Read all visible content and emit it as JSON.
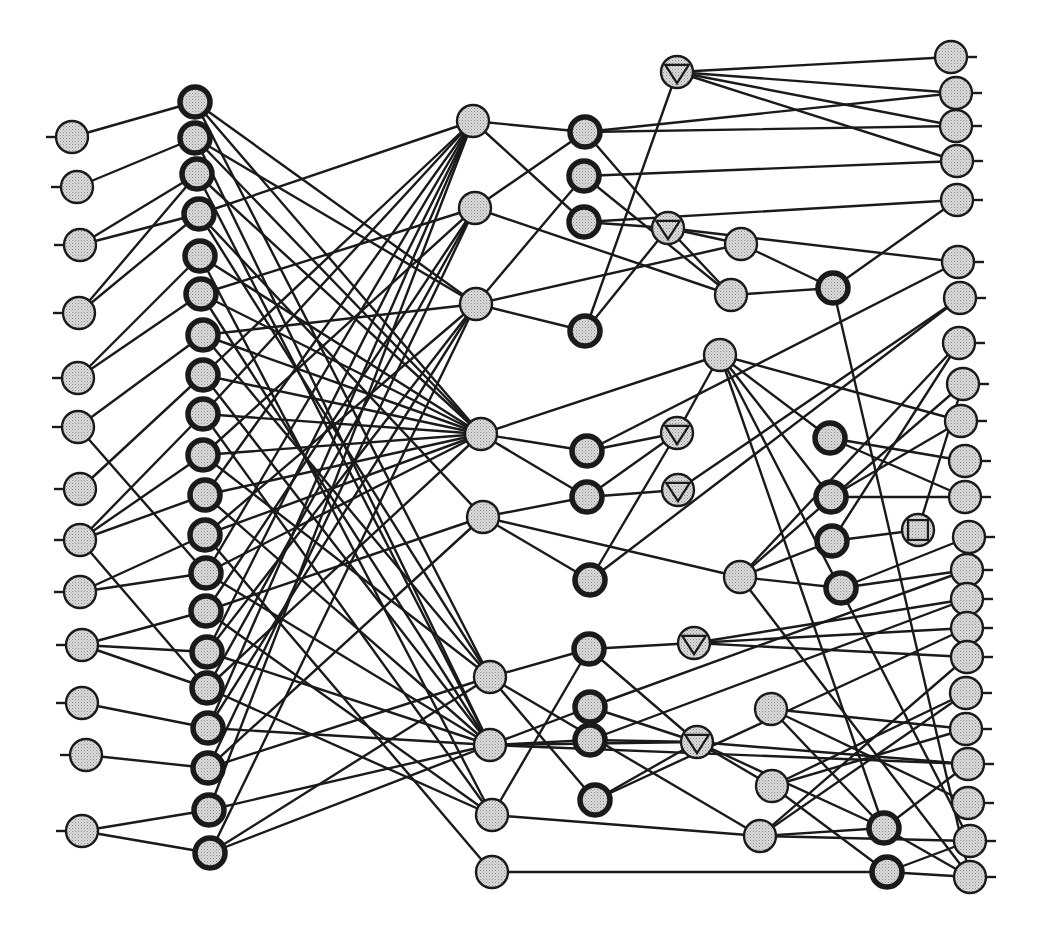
{
  "diagram": {
    "style": {
      "background": "#ffffff",
      "stroke": "#1a1a1a",
      "node_fill": "#d8d8d8",
      "node_dot": "#8a8a8a",
      "node_radius": 16
    },
    "node_types": {
      "input": "plain circle with left stub",
      "hidden_bold": "thick-bordered circle",
      "hidden": "plain circle",
      "triangle": "circle with inscribed down-triangle",
      "square": "circle with inscribed square",
      "output": "plain circle with right stub"
    },
    "nodes": [
      {
        "id": "I1",
        "type": "input",
        "x": 72,
        "y": 137
      },
      {
        "id": "I2",
        "type": "input",
        "x": 77,
        "y": 187
      },
      {
        "id": "I3",
        "type": "input",
        "x": 80,
        "y": 245
      },
      {
        "id": "I4",
        "type": "input",
        "x": 79,
        "y": 313
      },
      {
        "id": "I5",
        "type": "input",
        "x": 78,
        "y": 378
      },
      {
        "id": "I6",
        "type": "input",
        "x": 78,
        "y": 427
      },
      {
        "id": "I7",
        "type": "input",
        "x": 80,
        "y": 489
      },
      {
        "id": "I8",
        "type": "input",
        "x": 80,
        "y": 540
      },
      {
        "id": "I9",
        "type": "input",
        "x": 80,
        "y": 592
      },
      {
        "id": "I10",
        "type": "input",
        "x": 82,
        "y": 645
      },
      {
        "id": "I11",
        "type": "input",
        "x": 82,
        "y": 703
      },
      {
        "id": "I12",
        "type": "input",
        "x": 86,
        "y": 755
      },
      {
        "id": "I13",
        "type": "input",
        "x": 82,
        "y": 831
      },
      {
        "id": "B1",
        "type": "hidden_bold",
        "x": 195,
        "y": 102
      },
      {
        "id": "B2",
        "type": "hidden_bold",
        "x": 195,
        "y": 138
      },
      {
        "id": "B3",
        "type": "hidden_bold",
        "x": 197,
        "y": 174
      },
      {
        "id": "B4",
        "type": "hidden_bold",
        "x": 199,
        "y": 214
      },
      {
        "id": "B5",
        "type": "hidden_bold",
        "x": 200,
        "y": 256
      },
      {
        "id": "B6",
        "type": "hidden_bold",
        "x": 201,
        "y": 294
      },
      {
        "id": "B7",
        "type": "hidden_bold",
        "x": 203,
        "y": 335
      },
      {
        "id": "B8",
        "type": "hidden_bold",
        "x": 203,
        "y": 375
      },
      {
        "id": "B9",
        "type": "hidden_bold",
        "x": 203,
        "y": 414
      },
      {
        "id": "B10",
        "type": "hidden_bold",
        "x": 203,
        "y": 455
      },
      {
        "id": "B11",
        "type": "hidden_bold",
        "x": 205,
        "y": 495
      },
      {
        "id": "B12",
        "type": "hidden_bold",
        "x": 205,
        "y": 535
      },
      {
        "id": "B13",
        "type": "hidden_bold",
        "x": 206,
        "y": 573
      },
      {
        "id": "B14",
        "type": "hidden_bold",
        "x": 206,
        "y": 611
      },
      {
        "id": "B15",
        "type": "hidden_bold",
        "x": 207,
        "y": 652
      },
      {
        "id": "B16",
        "type": "hidden_bold",
        "x": 207,
        "y": 688
      },
      {
        "id": "B17",
        "type": "hidden_bold",
        "x": 208,
        "y": 728
      },
      {
        "id": "B18",
        "type": "hidden_bold",
        "x": 208,
        "y": 768
      },
      {
        "id": "B19",
        "type": "hidden_bold",
        "x": 209,
        "y": 810
      },
      {
        "id": "B20",
        "type": "hidden_bold",
        "x": 210,
        "y": 853
      },
      {
        "id": "C1",
        "type": "hidden",
        "x": 473,
        "y": 121
      },
      {
        "id": "C2",
        "type": "hidden",
        "x": 475,
        "y": 208
      },
      {
        "id": "C3",
        "type": "hidden",
        "x": 476,
        "y": 304
      },
      {
        "id": "C4",
        "type": "hidden",
        "x": 481,
        "y": 434
      },
      {
        "id": "C5",
        "type": "hidden",
        "x": 483,
        "y": 517
      },
      {
        "id": "C6",
        "type": "hidden",
        "x": 490,
        "y": 677
      },
      {
        "id": "C7",
        "type": "hidden",
        "x": 490,
        "y": 745
      },
      {
        "id": "C8",
        "type": "hidden",
        "x": 492,
        "y": 815
      },
      {
        "id": "C9",
        "type": "hidden",
        "x": 492,
        "y": 872
      },
      {
        "id": "D1",
        "type": "hidden_bold",
        "x": 585,
        "y": 132
      },
      {
        "id": "D2",
        "type": "hidden_bold",
        "x": 584,
        "y": 176
      },
      {
        "id": "D3",
        "type": "hidden_bold",
        "x": 584,
        "y": 222
      },
      {
        "id": "D4",
        "type": "hidden_bold",
        "x": 585,
        "y": 331
      },
      {
        "id": "D5",
        "type": "hidden_bold",
        "x": 587,
        "y": 451
      },
      {
        "id": "D6",
        "type": "hidden_bold",
        "x": 587,
        "y": 497
      },
      {
        "id": "D7",
        "type": "hidden_bold",
        "x": 590,
        "y": 580
      },
      {
        "id": "D8",
        "type": "hidden_bold",
        "x": 589,
        "y": 649
      },
      {
        "id": "D9",
        "type": "hidden_bold",
        "x": 590,
        "y": 707
      },
      {
        "id": "D10",
        "type": "hidden_bold",
        "x": 590,
        "y": 740
      },
      {
        "id": "D11",
        "type": "hidden_bold",
        "x": 595,
        "y": 800
      },
      {
        "id": "T1",
        "type": "triangle",
        "x": 677,
        "y": 72
      },
      {
        "id": "T2",
        "type": "triangle",
        "x": 668,
        "y": 228
      },
      {
        "id": "T3",
        "type": "triangle",
        "x": 677,
        "y": 433
      },
      {
        "id": "T4",
        "type": "triangle",
        "x": 678,
        "y": 490
      },
      {
        "id": "T5",
        "type": "triangle",
        "x": 694,
        "y": 643
      },
      {
        "id": "T6",
        "type": "triangle",
        "x": 697,
        "y": 742
      },
      {
        "id": "E1",
        "type": "hidden",
        "x": 741,
        "y": 244
      },
      {
        "id": "E2",
        "type": "hidden",
        "x": 731,
        "y": 295
      },
      {
        "id": "E3",
        "type": "hidden",
        "x": 720,
        "y": 355
      },
      {
        "id": "E4",
        "type": "hidden",
        "x": 740,
        "y": 577
      },
      {
        "id": "E5",
        "type": "hidden",
        "x": 771,
        "y": 709
      },
      {
        "id": "E6",
        "type": "hidden",
        "x": 772,
        "y": 786
      },
      {
        "id": "E7",
        "type": "hidden",
        "x": 760,
        "y": 836
      },
      {
        "id": "F1",
        "type": "hidden_bold",
        "x": 833,
        "y": 288
      },
      {
        "id": "F2",
        "type": "hidden_bold",
        "x": 830,
        "y": 438
      },
      {
        "id": "F3",
        "type": "hidden_bold",
        "x": 831,
        "y": 497
      },
      {
        "id": "F4",
        "type": "hidden_bold",
        "x": 832,
        "y": 541
      },
      {
        "id": "F5",
        "type": "hidden_bold",
        "x": 841,
        "y": 588
      },
      {
        "id": "F6",
        "type": "hidden_bold",
        "x": 884,
        "y": 828
      },
      {
        "id": "F7",
        "type": "hidden_bold",
        "x": 887,
        "y": 872
      },
      {
        "id": "S1",
        "type": "square",
        "x": 918,
        "y": 530
      },
      {
        "id": "O1",
        "type": "output",
        "x": 951,
        "y": 57
      },
      {
        "id": "O2",
        "type": "output",
        "x": 956,
        "y": 93
      },
      {
        "id": "O3",
        "type": "output",
        "x": 956,
        "y": 126
      },
      {
        "id": "O4",
        "type": "output",
        "x": 957,
        "y": 161
      },
      {
        "id": "O5",
        "type": "output",
        "x": 957,
        "y": 200
      },
      {
        "id": "O6",
        "type": "output",
        "x": 958,
        "y": 262
      },
      {
        "id": "O7",
        "type": "output",
        "x": 960,
        "y": 298
      },
      {
        "id": "O8",
        "type": "output",
        "x": 959,
        "y": 343
      },
      {
        "id": "O9",
        "type": "output",
        "x": 963,
        "y": 384
      },
      {
        "id": "O10",
        "type": "output",
        "x": 961,
        "y": 421
      },
      {
        "id": "O11",
        "type": "output",
        "x": 965,
        "y": 461
      },
      {
        "id": "O12",
        "type": "output",
        "x": 965,
        "y": 497
      },
      {
        "id": "O13",
        "type": "output",
        "x": 969,
        "y": 537
      },
      {
        "id": "O14",
        "type": "output",
        "x": 967,
        "y": 570
      },
      {
        "id": "O15",
        "type": "output",
        "x": 967,
        "y": 599
      },
      {
        "id": "O16",
        "type": "output",
        "x": 967,
        "y": 628
      },
      {
        "id": "O17",
        "type": "output",
        "x": 967,
        "y": 657
      },
      {
        "id": "O18",
        "type": "output",
        "x": 966,
        "y": 693
      },
      {
        "id": "O19",
        "type": "output",
        "x": 966,
        "y": 729
      },
      {
        "id": "O20",
        "type": "output",
        "x": 968,
        "y": 764
      },
      {
        "id": "O21",
        "type": "output",
        "x": 968,
        "y": 803
      },
      {
        "id": "O22",
        "type": "output",
        "x": 970,
        "y": 841
      },
      {
        "id": "O23",
        "type": "output",
        "x": 970,
        "y": 877
      }
    ],
    "edges": [
      [
        "I1",
        "B1"
      ],
      [
        "I2",
        "B2"
      ],
      [
        "I3",
        "B3"
      ],
      [
        "I3",
        "B4"
      ],
      [
        "I4",
        "B3"
      ],
      [
        "I4",
        "B4"
      ],
      [
        "I5",
        "B5"
      ],
      [
        "I5",
        "B6"
      ],
      [
        "I6",
        "B7"
      ],
      [
        "I6",
        "B13"
      ],
      [
        "I7",
        "B8"
      ],
      [
        "I8",
        "B9"
      ],
      [
        "I8",
        "B10"
      ],
      [
        "I8",
        "B11"
      ],
      [
        "I8",
        "B16"
      ],
      [
        "I9",
        "B12"
      ],
      [
        "I9",
        "B13"
      ],
      [
        "I10",
        "B14"
      ],
      [
        "I10",
        "B15"
      ],
      [
        "I10",
        "B16"
      ],
      [
        "I11",
        "B17"
      ],
      [
        "I12",
        "B18"
      ],
      [
        "I13",
        "B19"
      ],
      [
        "I13",
        "B20"
      ],
      [
        "B1",
        "C3"
      ],
      [
        "B1",
        "C6"
      ],
      [
        "B1",
        "C4"
      ],
      [
        "B2",
        "C3"
      ],
      [
        "B2",
        "C7"
      ],
      [
        "B2",
        "C4"
      ],
      [
        "B3",
        "C4"
      ],
      [
        "B3",
        "C7"
      ],
      [
        "B4",
        "C1"
      ],
      [
        "B4",
        "C6"
      ],
      [
        "B4",
        "C5"
      ],
      [
        "B5",
        "C4"
      ],
      [
        "B5",
        "C8"
      ],
      [
        "B6",
        "C2"
      ],
      [
        "B6",
        "C4"
      ],
      [
        "B6",
        "C7"
      ],
      [
        "B7",
        "C3"
      ],
      [
        "B7",
        "C4"
      ],
      [
        "B7",
        "C6"
      ],
      [
        "B8",
        "C1"
      ],
      [
        "B8",
        "C4"
      ],
      [
        "B8",
        "C7"
      ],
      [
        "B9",
        "C1"
      ],
      [
        "B9",
        "C4"
      ],
      [
        "B9",
        "C8"
      ],
      [
        "B10",
        "C2"
      ],
      [
        "B10",
        "C4"
      ],
      [
        "B10",
        "C6"
      ],
      [
        "B11",
        "C1"
      ],
      [
        "B11",
        "C4"
      ],
      [
        "B11",
        "C7"
      ],
      [
        "B12",
        "C3"
      ],
      [
        "B12",
        "C4"
      ],
      [
        "B12",
        "C9"
      ],
      [
        "B13",
        "C1"
      ],
      [
        "B13",
        "C4"
      ],
      [
        "B13",
        "C7"
      ],
      [
        "B14",
        "C2"
      ],
      [
        "B14",
        "C5"
      ],
      [
        "B14",
        "C8"
      ],
      [
        "B15",
        "C1"
      ],
      [
        "B15",
        "C3"
      ],
      [
        "B15",
        "C7"
      ],
      [
        "B16",
        "C2"
      ],
      [
        "B16",
        "C4"
      ],
      [
        "B16",
        "C8"
      ],
      [
        "B17",
        "C1"
      ],
      [
        "B17",
        "C3"
      ],
      [
        "B17",
        "C7"
      ],
      [
        "B18",
        "C2"
      ],
      [
        "B18",
        "C5"
      ],
      [
        "B18",
        "C6"
      ],
      [
        "B19",
        "C1"
      ],
      [
        "B19",
        "C7"
      ],
      [
        "B20",
        "C3"
      ],
      [
        "B20",
        "C6"
      ],
      [
        "B20",
        "C7"
      ],
      [
        "C1",
        "D1"
      ],
      [
        "C1",
        "D3"
      ],
      [
        "C2",
        "D1"
      ],
      [
        "C2",
        "E2"
      ],
      [
        "C3",
        "D2"
      ],
      [
        "C3",
        "D4"
      ],
      [
        "C3",
        "E1"
      ],
      [
        "C4",
        "D5"
      ],
      [
        "C4",
        "D6"
      ],
      [
        "C4",
        "E3"
      ],
      [
        "C5",
        "D6"
      ],
      [
        "C5",
        "D7"
      ],
      [
        "C5",
        "E4"
      ],
      [
        "C6",
        "D8"
      ],
      [
        "C6",
        "E7"
      ],
      [
        "C6",
        "D11"
      ],
      [
        "C7",
        "D9"
      ],
      [
        "C7",
        "D10"
      ],
      [
        "C7",
        "T6"
      ],
      [
        "C7",
        "O20"
      ],
      [
        "C8",
        "D8"
      ],
      [
        "C8",
        "E7"
      ],
      [
        "C9",
        "F7"
      ],
      [
        "D1",
        "O2"
      ],
      [
        "D1",
        "O3"
      ],
      [
        "D1",
        "T2"
      ],
      [
        "D2",
        "O4"
      ],
      [
        "D2",
        "E2"
      ],
      [
        "D3",
        "O5"
      ],
      [
        "D3",
        "T2"
      ],
      [
        "D4",
        "T1"
      ],
      [
        "D4",
        "T2"
      ],
      [
        "D5",
        "T3"
      ],
      [
        "D5",
        "O6"
      ],
      [
        "D6",
        "T4"
      ],
      [
        "D6",
        "T3"
      ],
      [
        "D7",
        "T3"
      ],
      [
        "D7",
        "O7"
      ],
      [
        "D8",
        "T5"
      ],
      [
        "D8",
        "T6"
      ],
      [
        "D9",
        "O14"
      ],
      [
        "D9",
        "T6"
      ],
      [
        "D10",
        "T6"
      ],
      [
        "D10",
        "O15"
      ],
      [
        "D11",
        "O16"
      ],
      [
        "D11",
        "T6"
      ],
      [
        "T1",
        "O1"
      ],
      [
        "T1",
        "O2"
      ],
      [
        "T1",
        "O3"
      ],
      [
        "T1",
        "O4"
      ],
      [
        "T2",
        "E1"
      ],
      [
        "T2",
        "E2"
      ],
      [
        "T2",
        "O6"
      ],
      [
        "T3",
        "E3"
      ],
      [
        "T4",
        "O7"
      ],
      [
        "T5",
        "O17"
      ],
      [
        "T5",
        "O16"
      ],
      [
        "T5",
        "O15"
      ],
      [
        "T6",
        "E6"
      ],
      [
        "T6",
        "O20"
      ],
      [
        "T6",
        "F6"
      ],
      [
        "E1",
        "F1"
      ],
      [
        "E2",
        "F1"
      ],
      [
        "E3",
        "O10"
      ],
      [
        "E3",
        "F2"
      ],
      [
        "E3",
        "F3"
      ],
      [
        "E3",
        "F6"
      ],
      [
        "E3",
        "O22"
      ],
      [
        "E4",
        "O8"
      ],
      [
        "E4",
        "F4"
      ],
      [
        "E4",
        "F5"
      ],
      [
        "E4",
        "O9"
      ],
      [
        "E4",
        "O23"
      ],
      [
        "E5",
        "O19"
      ],
      [
        "E5",
        "O21"
      ],
      [
        "E5",
        "F6"
      ],
      [
        "E6",
        "O18"
      ],
      [
        "E6",
        "O19"
      ],
      [
        "E6",
        "F7"
      ],
      [
        "E7",
        "O17"
      ],
      [
        "E7",
        "O18"
      ],
      [
        "E7",
        "F6"
      ],
      [
        "E7",
        "O22"
      ],
      [
        "F1",
        "O5"
      ],
      [
        "F1",
        "O23"
      ],
      [
        "F2",
        "O11"
      ],
      [
        "F2",
        "O12"
      ],
      [
        "F3",
        "O12"
      ],
      [
        "F3",
        "O10"
      ],
      [
        "F4",
        "S1"
      ],
      [
        "F4",
        "O8"
      ],
      [
        "F5",
        "O13"
      ],
      [
        "F5",
        "O14"
      ],
      [
        "F6",
        "O20"
      ],
      [
        "F6",
        "O23"
      ],
      [
        "F7",
        "O22"
      ],
      [
        "F7",
        "O23"
      ],
      [
        "S1",
        "O9"
      ]
    ]
  }
}
